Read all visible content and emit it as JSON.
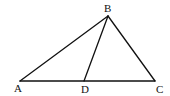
{
  "diagram": {
    "type": "triangle-with-cevian",
    "points": {
      "A": {
        "label": "A",
        "x": 20,
        "y": 81,
        "label_x": 14,
        "label_y": 92
      },
      "B": {
        "label": "B",
        "x": 108,
        "y": 16,
        "label_x": 104,
        "label_y": 12
      },
      "C": {
        "label": "C",
        "x": 155,
        "y": 81,
        "label_x": 156,
        "label_y": 93
      },
      "D": {
        "label": "D",
        "x": 84,
        "y": 81,
        "label_x": 81,
        "label_y": 93
      }
    },
    "segments": [
      {
        "from": "A",
        "to": "B"
      },
      {
        "from": "B",
        "to": "C"
      },
      {
        "from": "A",
        "to": "C"
      },
      {
        "from": "B",
        "to": "D"
      }
    ],
    "stroke_color": "#111111"
  }
}
